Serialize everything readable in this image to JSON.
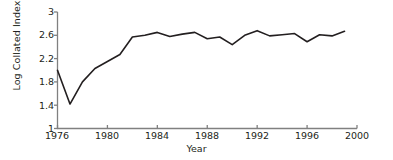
{
  "chart_data": {
    "type": "line",
    "title": "",
    "xlabel": "Year",
    "ylabel": "Log Collated Index",
    "xlim": [
      1976,
      2000
    ],
    "ylim": [
      1,
      3
    ],
    "xticks": [
      "1976",
      "1980",
      "1984",
      "1988",
      "1992",
      "1996",
      "2000"
    ],
    "xtick_values": [
      1976,
      1980,
      1984,
      1988,
      1992,
      1996,
      2000
    ],
    "yticks": [
      "1",
      "1.4",
      "1.8",
      "2.2",
      "2.6",
      "3"
    ],
    "ytick_values": [
      1,
      1.4,
      1.8,
      2.2,
      2.6,
      3
    ],
    "grid": false,
    "legend": null,
    "series": [
      {
        "name": "Log Collated Index",
        "color": "#231f20",
        "x": [
          1976,
          1977,
          1978,
          1979,
          1980,
          1981,
          1982,
          1983,
          1984,
          1985,
          1986,
          1987,
          1988,
          1989,
          1990,
          1991,
          1992,
          1993,
          1994,
          1995,
          1996,
          1997,
          1998,
          1999
        ],
        "values": [
          2.0,
          1.42,
          1.8,
          2.03,
          2.15,
          2.27,
          2.57,
          2.6,
          2.65,
          2.58,
          2.62,
          2.65,
          2.54,
          2.57,
          2.44,
          2.6,
          2.68,
          2.59,
          2.61,
          2.63,
          2.49,
          2.61,
          2.59,
          2.67
        ]
      }
    ]
  },
  "axis": {
    "line_color": "#808080",
    "tick_color": "#808080"
  }
}
